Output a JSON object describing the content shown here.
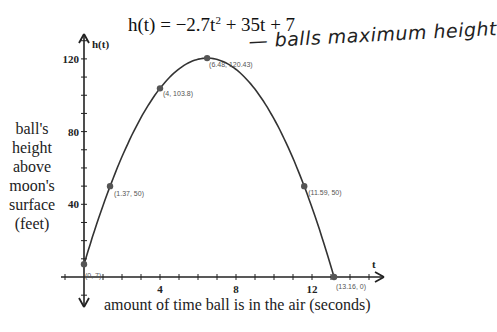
{
  "chart_data": {
    "type": "line",
    "equation": {
      "prefix": "h(t) = −2.7t",
      "exponent": "2",
      "suffix": " + 35t + 7"
    },
    "annotation": "— balls maximum height",
    "xlabel": "amount of time ball is in the air (seconds)",
    "ylabel_lines": [
      "ball's",
      "height",
      "above",
      "moon's",
      "surface",
      "(feet)"
    ],
    "x_axis_name": "t",
    "y_axis_name": "h(t)",
    "xlim": [
      -1,
      15.8
    ],
    "ylim": [
      -10,
      133
    ],
    "x_ticks": [
      4,
      8,
      12
    ],
    "y_ticks": [
      40,
      80,
      120
    ],
    "grid": false,
    "series": [
      {
        "name": "h(t)",
        "coefficients": {
          "a": -2.7,
          "b": 35,
          "c": 7
        },
        "domain": [
          0,
          13.16
        ]
      }
    ],
    "points": [
      {
        "x": 0,
        "y": 7,
        "label": "(0, 7)"
      },
      {
        "x": 1.37,
        "y": 50,
        "label": "(1.37, 50)"
      },
      {
        "x": 4,
        "y": 103.8,
        "label": "(4, 103.8)"
      },
      {
        "x": 6.48,
        "y": 120.43,
        "label": "(6.48, 120.43)"
      },
      {
        "x": 11.59,
        "y": 50,
        "label": "(11.59, 50)"
      },
      {
        "x": 13.16,
        "y": 0,
        "label": "(13.16, 0)"
      }
    ],
    "colors": {
      "curve": "#333333",
      "axis": "#222222",
      "point": "#555555"
    }
  }
}
